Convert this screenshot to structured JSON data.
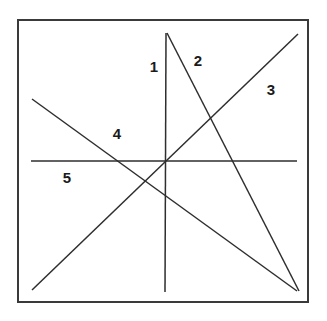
{
  "figure": {
    "background_color": "#ffffff",
    "line_color": "#2e2e2e",
    "border_color": "#3a3a3a",
    "label_color": "#1a1a1a",
    "canvas": {
      "width": 327,
      "height": 321
    },
    "frame": {
      "x": 18,
      "y": 20,
      "width": 290,
      "height": 282
    },
    "lines": [
      {
        "id": "line-1",
        "label": "1",
        "description": "vertical line",
        "x1": 166,
        "y1": 33,
        "x2": 165,
        "y2": 292,
        "label_x": 154,
        "label_y": 68
      },
      {
        "id": "line-2",
        "label": "2",
        "description": "steep line from top apex down to bottom-right",
        "x1": 167,
        "y1": 33,
        "x2": 299,
        "y2": 291,
        "label_x": 198,
        "label_y": 62
      },
      {
        "id": "line-3",
        "label": "3",
        "description": "diagonal from bottom-left up to top-right",
        "x1": 32,
        "y1": 290,
        "x2": 298,
        "y2": 34,
        "label_x": 271,
        "label_y": 91
      },
      {
        "id": "line-4",
        "label": "4",
        "description": "diagonal from upper-left down to bottom-right",
        "x1": 32,
        "y1": 99,
        "x2": 297,
        "y2": 291,
        "label_x": 117,
        "label_y": 135
      },
      {
        "id": "line-5",
        "label": "5",
        "description": "horizontal line",
        "x1": 31,
        "y1": 161,
        "x2": 297,
        "y2": 161,
        "label_x": 67,
        "label_y": 179
      }
    ]
  }
}
